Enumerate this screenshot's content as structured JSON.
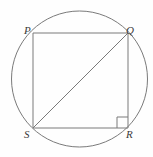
{
  "figure": {
    "canvas": {
      "width": 153,
      "height": 157,
      "background": "#fefefe"
    },
    "stroke_color": "#7a7a7a",
    "label_color": "#3a3a3a",
    "circle": {
      "name": "circumcircle",
      "cx": 79.5,
      "cy": 79,
      "r": 68,
      "stroke_width": 1
    },
    "vertices": [
      {
        "id": "P",
        "label": "P",
        "x": 33,
        "y": 33
      },
      {
        "id": "Q",
        "label": "Q",
        "x": 128,
        "y": 33
      },
      {
        "id": "R",
        "label": "R",
        "x": 128,
        "y": 128
      },
      {
        "id": "S",
        "label": "S",
        "x": 33,
        "y": 128
      }
    ],
    "edges": [
      {
        "name": "edge-PQ",
        "from": "P",
        "to": "Q"
      },
      {
        "name": "edge-QR",
        "from": "Q",
        "to": "R"
      },
      {
        "name": "edge-RS",
        "from": "R",
        "to": "S"
      },
      {
        "name": "edge-SP",
        "from": "S",
        "to": "P"
      }
    ],
    "diagonal": {
      "name": "diagonal-SQ",
      "from": "S",
      "to": "Q"
    },
    "right_angle_marker": {
      "name": "right-angle-at-R",
      "at_vertex": "R",
      "size": 11
    }
  }
}
